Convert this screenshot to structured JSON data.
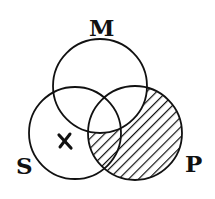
{
  "diagram": {
    "type": "venn",
    "sets": [
      {
        "id": "M",
        "label": "M",
        "cx": 100,
        "cy": 86,
        "r": 47,
        "label_x": 89,
        "label_y": 36
      },
      {
        "id": "S",
        "label": "S",
        "cx": 75,
        "cy": 133,
        "r": 46,
        "label_x": 16,
        "label_y": 174
      },
      {
        "id": "P",
        "label": "P",
        "cx": 135,
        "cy": 133,
        "r": 47,
        "label_x": 185,
        "label_y": 172
      }
    ],
    "shaded_region": "P minus M (hatched)",
    "mark": {
      "symbol": "x",
      "region": "S only",
      "x": 65,
      "y": 141
    },
    "colors": {
      "stroke": "#111111",
      "background": "#ffffff",
      "hatch": "#111111"
    }
  }
}
